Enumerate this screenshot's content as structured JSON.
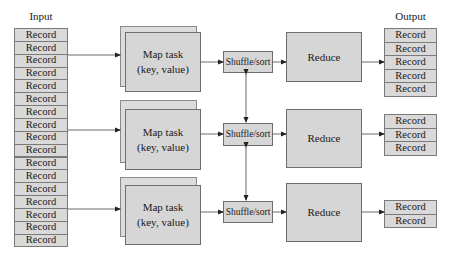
{
  "input": {
    "title": "Input",
    "record_label": "Record",
    "records": [
      "Record",
      "Record",
      "Record",
      "Record",
      "Record",
      "Record",
      "Record",
      "Record",
      "Record",
      "Record",
      "Record",
      "Record",
      "Record",
      "Record",
      "Record",
      "Record",
      "Record"
    ]
  },
  "map_tasks": [
    {
      "line1": "Map task",
      "line2": "(key, value)"
    },
    {
      "line1": "Map task",
      "line2": "(key, value)"
    },
    {
      "line1": "Map task",
      "line2": "(key, value)"
    }
  ],
  "shuffle": [
    {
      "label": "Shuffle/sort"
    },
    {
      "label": "Shuffle/sort"
    },
    {
      "label": "Shuffle/sort"
    }
  ],
  "reduce": [
    {
      "label": "Reduce"
    },
    {
      "label": "Reduce"
    },
    {
      "label": "Reduce"
    }
  ],
  "output": {
    "title": "Output",
    "groups": [
      [
        "Record",
        "Record",
        "Record",
        "Record",
        "Record"
      ],
      [
        "Record",
        "Record",
        "Record"
      ],
      [
        "Record",
        "Record"
      ]
    ]
  },
  "colors": {
    "box_fill": "#d6d6d6",
    "record_fill": "#d9d9d9",
    "border": "#6e6e6e",
    "line": "#333333"
  }
}
